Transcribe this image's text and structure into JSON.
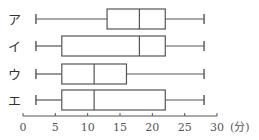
{
  "chart_data": {
    "type": "boxplot",
    "title": "",
    "xlabel": "",
    "unit_label": "(分)",
    "xlim": [
      0,
      30
    ],
    "x_ticks": [
      0,
      5,
      10,
      15,
      20,
      25,
      30
    ],
    "grid": false,
    "legend": null,
    "categories": [
      "ア",
      "イ",
      "ウ",
      "エ"
    ],
    "series": [
      {
        "name": "ア",
        "min": 2,
        "q1": 13,
        "median": 18,
        "q3": 22,
        "max": 28
      },
      {
        "name": "イ",
        "min": 2,
        "q1": 6,
        "median": 18,
        "q3": 22,
        "max": 28
      },
      {
        "name": "ウ",
        "min": 2,
        "q1": 6,
        "median": 11,
        "q3": 16,
        "max": 28
      },
      {
        "name": "エ",
        "min": 2,
        "q1": 6,
        "median": 11,
        "q3": 22,
        "max": 28
      }
    ]
  },
  "colors": {
    "line": "#555555",
    "text": "#333333"
  }
}
